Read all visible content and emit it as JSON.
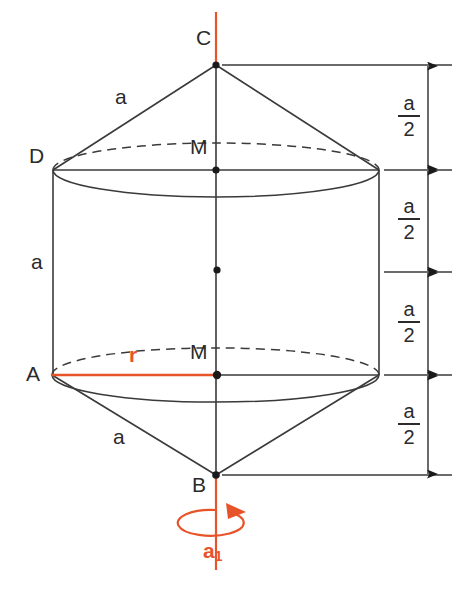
{
  "figure": {
    "canvas": {
      "width": 461,
      "height": 598
    },
    "colors": {
      "line": "#2b2b2b",
      "accent": "#e8542a",
      "background": "#ffffff"
    },
    "points": [
      {
        "id": "C",
        "label": "C",
        "x": 216,
        "y": 65,
        "label_x": 196,
        "label_y": 39
      },
      {
        "id": "D",
        "label": "D",
        "x": 55,
        "y": 170,
        "label_x": 31,
        "label_y": 155
      },
      {
        "id": "M_top",
        "label": "M",
        "x": 216,
        "y": 170,
        "label_x": 192,
        "label_y": 144
      },
      {
        "id": "M_center",
        "label": "",
        "x": 217,
        "y": 270,
        "label_x": 0,
        "label_y": 0
      },
      {
        "id": "A",
        "label": "A",
        "x": 52,
        "y": 375,
        "label_x": 28,
        "label_y": 370
      },
      {
        "id": "M_bottom",
        "label": "M",
        "x": 217,
        "y": 375,
        "label_x": 192,
        "label_y": 349
      },
      {
        "id": "B",
        "label": "B",
        "x": 216,
        "y": 475,
        "label_x": 194,
        "label_y": 481
      }
    ],
    "edge_labels": [
      {
        "id": "slant-top",
        "text": "a",
        "x": 117,
        "y": 90
      },
      {
        "id": "side-left",
        "text": "a",
        "x": 33,
        "y": 258
      },
      {
        "id": "slant-bottom",
        "text": "a",
        "x": 115,
        "y": 432
      },
      {
        "id": "radius",
        "text": "r",
        "x": 131,
        "y": 352,
        "accent": true
      }
    ],
    "axis_label": {
      "text": "a",
      "subscript": "1",
      "x": 205,
      "y": 546
    },
    "dimensions": {
      "label_numerator": "a",
      "label_denominator": "2",
      "segments": [
        {
          "id": "seg-1",
          "from_y": 65,
          "to_y": 170,
          "label_y": 100
        },
        {
          "id": "seg-2",
          "from_y": 170,
          "to_y": 272,
          "label_y": 203
        },
        {
          "id": "seg-3",
          "from_y": 272,
          "to_y": 375,
          "label_y": 306
        },
        {
          "id": "seg-4",
          "from_y": 375,
          "to_y": 475,
          "label_y": 408
        }
      ]
    },
    "geometry_notes": {
      "cylinder_left_x": 52,
      "cylinder_right_x": 380,
      "ellipse_rx": 164,
      "ellipse_ry": 26,
      "dimension_line_x": 428,
      "rotation_axis_x": 216
    }
  }
}
